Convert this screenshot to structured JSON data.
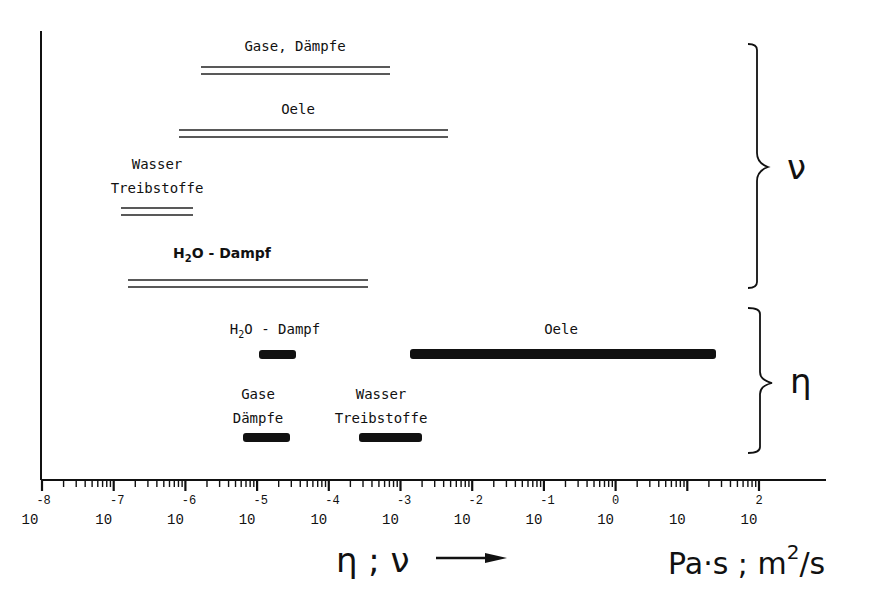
{
  "chart_data": {
    "type": "bar",
    "subtype": "horizontal-range (log scale)",
    "title": "",
    "xlabel": "η ; ν →",
    "xunits": "Pa·s ; m²/s",
    "xscale": "log",
    "xlim": [
      1e-08,
      1000.0
    ],
    "xticks": [
      "10^-8",
      "10^-7",
      "10^-6",
      "10^-5",
      "10^-4",
      "10^-3",
      "10^-2",
      "10^-1",
      "10^0",
      "10",
      "10^2"
    ],
    "groups": [
      {
        "name": "ν",
        "description": "kinematic viscosity (m²/s)",
        "style": "double-line",
        "ranges": [
          {
            "label": "Gase, Dämpfe",
            "min": 1.7e-06,
            "max": 0.0007
          },
          {
            "label": "Oele",
            "min": 8e-07,
            "max": 0.0046
          },
          {
            "label": "Wasser Treibstoffe",
            "min": 1.3e-07,
            "max": 1.3e-06
          },
          {
            "label": "H2O - Dampf",
            "min": 1.6e-07,
            "max": 0.00035
          }
        ]
      },
      {
        "name": "η",
        "description": "dynamic viscosity (Pa·s)",
        "style": "thick-bar",
        "ranges": [
          {
            "label": "H2O - Dampf",
            "min": 1.1e-05,
            "max": 3.5e-05
          },
          {
            "label": "Oele",
            "min": 0.00135,
            "max": 25
          },
          {
            "label": "Gase Dämpfe",
            "min": 6.3e-06,
            "max": 2.9e-05
          },
          {
            "label": "Wasser Treibstoffe",
            "min": 0.00026,
            "max": 0.002
          }
        ]
      }
    ],
    "grid": false,
    "legend": "braces on right: upper group ν, lower group η"
  },
  "labels": {
    "nu_gase": "Gase, Dämpfe",
    "nu_oele": "Oele",
    "nu_wasser_1": "Wasser",
    "nu_wasser_2": "Treibstoffe",
    "nu_h2o_main": "H",
    "nu_h2o_sub": "2",
    "nu_h2o_rest": "O - Dampf",
    "eta_h2o_main": "H",
    "eta_h2o_sub": "2",
    "eta_h2o_rest": "O - Dampf",
    "eta_oele": "Oele",
    "eta_gase_1": "Gase",
    "eta_gase_2": "Dämpfe",
    "eta_wasser_1": "Wasser",
    "eta_wasser_2": "Treibstoffe"
  },
  "ticks": [
    {
      "base": "10",
      "exp": "-8"
    },
    {
      "base": "10",
      "exp": "-7"
    },
    {
      "base": "10",
      "exp": "-6"
    },
    {
      "base": "10",
      "exp": "-5"
    },
    {
      "base": "10",
      "exp": "-4"
    },
    {
      "base": "10",
      "exp": "-3"
    },
    {
      "base": "10",
      "exp": "-2"
    },
    {
      "base": "10",
      "exp": "-1"
    },
    {
      "base": "10",
      "exp": "0"
    },
    {
      "base": "10",
      "exp": ""
    },
    {
      "base": "10",
      "exp": "2"
    }
  ],
  "braces": {
    "upper": "ν",
    "lower": "η"
  },
  "axis": {
    "title": "η ; ν",
    "units_main": "Pa·s ; m",
    "units_sup": "2",
    "units_tail": "/s"
  }
}
